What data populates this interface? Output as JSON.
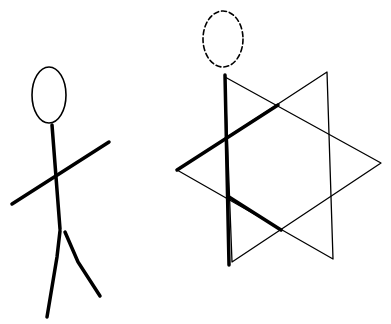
{
  "figures": [
    {
      "name": "stick-figure",
      "head": {
        "cx": 49,
        "cy": 95,
        "rx": 17,
        "ry": 28,
        "style": "solid"
      },
      "spine": [
        [
          52,
          125
        ],
        [
          60,
          229
        ]
      ],
      "arms": [
        [
          12,
          204
        ],
        [
          109,
          142
        ]
      ],
      "left_leg": [
        [
          60,
          231
        ],
        [
          57,
          257
        ],
        [
          47,
          317
        ]
      ],
      "right_leg": [
        [
          65,
          232
        ],
        [
          78,
          262
        ],
        [
          100,
          296
        ]
      ]
    },
    {
      "name": "star-figure",
      "head": {
        "cx": 223,
        "cy": 39,
        "rx": 20,
        "ry": 28,
        "style": "dashed"
      },
      "triangle_left": [
        [
          177,
          170
        ],
        [
          327,
          72
        ],
        [
          333,
          259
        ]
      ],
      "triangle_right": [
        [
          225,
          77
        ],
        [
          381,
          163
        ],
        [
          232,
          262
        ]
      ],
      "thick_spine": [
        [
          225,
          75
        ],
        [
          229,
          265
        ]
      ],
      "thick_arm": [
        [
          177,
          170
        ],
        [
          278,
          105
        ]
      ],
      "thick_leg": [
        [
          229,
          197
        ],
        [
          281,
          230
        ]
      ]
    }
  ],
  "colors": {
    "ink": "#000000",
    "background": "#ffffff"
  }
}
